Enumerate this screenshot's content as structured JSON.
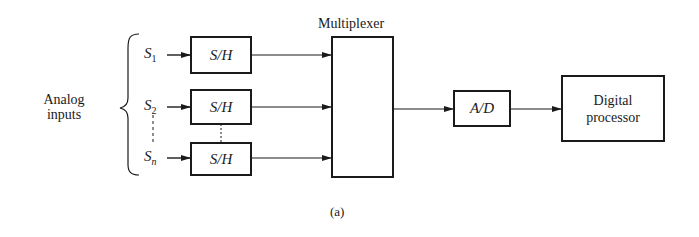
{
  "diagram": {
    "caption": "(a)",
    "group_label_line1": "Analog",
    "group_label_line2": "inputs",
    "inputs": [
      {
        "name": "S",
        "sub": "1"
      },
      {
        "name": "S",
        "sub": "2"
      },
      {
        "name": "S",
        "sub": "n"
      }
    ],
    "sample_hold": [
      "S/H",
      "S/H",
      "S/H"
    ],
    "multiplexer_label": "Multiplexer",
    "adc_label": "A/D",
    "processor_line1": "Digital",
    "processor_line2": "processor",
    "colors": {
      "line": "#1a1a1a",
      "background": "#ffffff"
    }
  }
}
